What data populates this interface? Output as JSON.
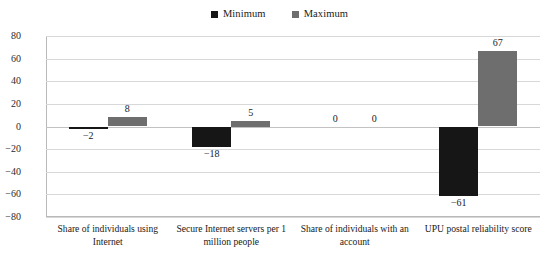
{
  "chart_data": {
    "type": "bar",
    "title": "",
    "subtitle": "",
    "xlabel": "",
    "ylabel": "",
    "ylim": [
      -80,
      80
    ],
    "yticks": [
      80,
      60,
      40,
      20,
      0,
      "−20",
      "−40",
      "−60",
      "−80"
    ],
    "grid": true,
    "legend_position": "top-center",
    "categories": [
      "Share of individuals using Internet",
      "Secure Internet servers per 1 million people",
      "Share of individuals with an account",
      "UPU postal reliability score"
    ],
    "series": [
      {
        "name": "Minimum",
        "color": "#161616",
        "values": [
          -2,
          -18,
          0,
          -61
        ],
        "labels": [
          "−2",
          "−18",
          "0",
          "−61"
        ]
      },
      {
        "name": "Maximum",
        "color": "#6e6e6e",
        "values": [
          8,
          5,
          0,
          67
        ],
        "labels": [
          "8",
          "5",
          "0",
          "67"
        ]
      }
    ]
  },
  "legend": {
    "items": [
      {
        "label": "Minimum",
        "color": "#161616"
      },
      {
        "label": "Maximum",
        "color": "#6e6e6e"
      }
    ]
  }
}
